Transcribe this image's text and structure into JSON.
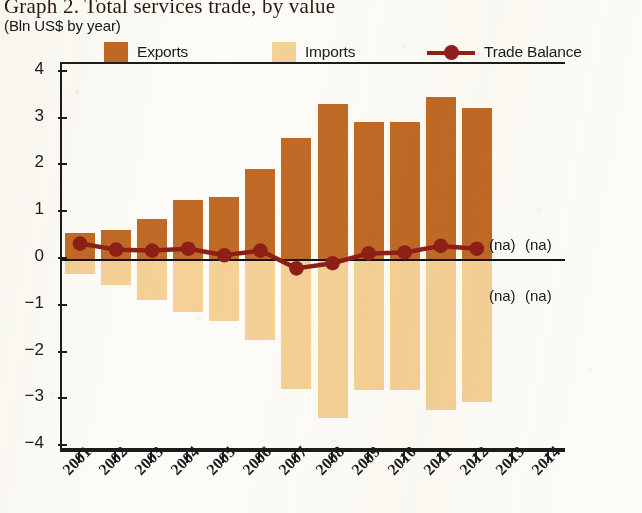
{
  "header": {
    "title": "Graph 2. Total services trade, by value",
    "subtitle": "(Bln US$ by year)"
  },
  "legend": {
    "items": [
      {
        "label": "Exports",
        "marker": "square-swatch",
        "color": "#c06a26"
      },
      {
        "label": "Imports",
        "marker": "square-swatch",
        "color": "#f5d197"
      },
      {
        "label": "Trade Balance",
        "marker": "line-with-dot",
        "color": "#8e1f17"
      }
    ]
  },
  "annotations": {
    "na_label": "(na)",
    "positions": [
      {
        "year": "2013",
        "side": "above-axis"
      },
      {
        "year": "2014",
        "side": "above-axis"
      },
      {
        "year": "2013",
        "side": "below-axis"
      },
      {
        "year": "2014",
        "side": "below-axis"
      }
    ]
  },
  "chart_data": {
    "type": "bar",
    "title": "Graph 2. Total services trade, by value",
    "subtitle": "(Bln US$ by year)",
    "xlabel": "",
    "ylabel": "",
    "ylim": [
      -4,
      4
    ],
    "yticks": [
      4,
      3,
      2,
      1,
      0,
      -1,
      -2,
      -3,
      -4
    ],
    "ytick_labels": [
      "4",
      "3",
      "2",
      "1",
      "0",
      "−1",
      "−2",
      "−3",
      "−4"
    ],
    "grid": false,
    "legend_position": "top",
    "categories": [
      "2001",
      "2002",
      "2003",
      "2004",
      "2005",
      "2006",
      "2007",
      "2008",
      "2009",
      "2010",
      "2011",
      "2012",
      "2013",
      "2014"
    ],
    "series": [
      {
        "name": "Exports",
        "type": "bar",
        "color": "#c06a26",
        "values": [
          0.55,
          0.62,
          0.85,
          1.26,
          1.32,
          1.92,
          2.58,
          3.32,
          2.92,
          2.93,
          3.47,
          3.23,
          null,
          null
        ]
      },
      {
        "name": "Imports",
        "type": "bar",
        "color": "#f5d197",
        "values": [
          -0.32,
          -0.55,
          -0.88,
          -1.14,
          -1.32,
          -1.73,
          -2.77,
          -3.4,
          -2.8,
          -2.8,
          -3.22,
          -3.05,
          null,
          null
        ]
      },
      {
        "name": "Trade Balance",
        "type": "line",
        "color": "#8e1f17",
        "values": [
          0.33,
          0.2,
          0.18,
          0.22,
          0.08,
          0.18,
          -0.2,
          -0.09,
          0.12,
          0.14,
          0.28,
          0.22,
          null,
          null
        ]
      }
    ],
    "missing_marker": "(na)",
    "missing_years": [
      "2013",
      "2014"
    ]
  }
}
